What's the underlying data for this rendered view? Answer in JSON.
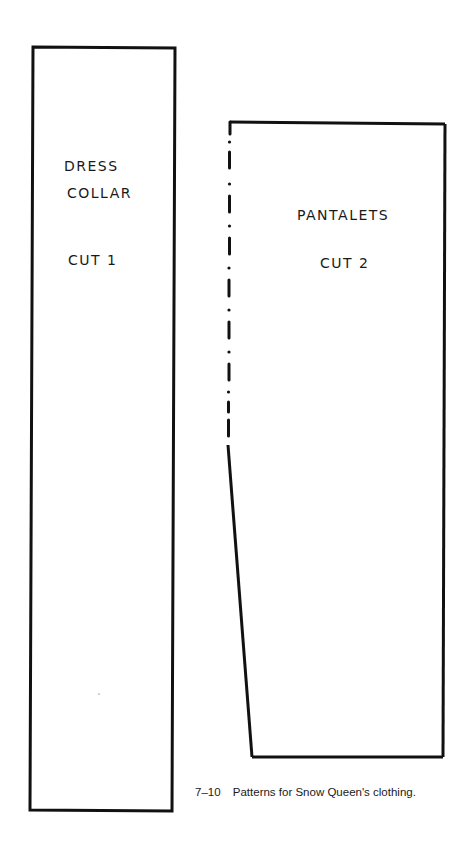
{
  "figure": {
    "caption_number": "7–10",
    "caption_text": "Patterns for Snow Queen's clothing."
  },
  "patterns": [
    {
      "name": "Dress Collar pattern",
      "label_line1": "DRESS",
      "label_line2": "COLLAR",
      "cut_instruction": "CUT 1"
    },
    {
      "name": "Pantalets pattern",
      "label_line1": "PANTALETS",
      "cut_instruction": "CUT 2",
      "fold_edge": "dash-dot line on left edge (place on fold)"
    }
  ],
  "colors": {
    "line": "#111111",
    "background": "#ffffff"
  }
}
